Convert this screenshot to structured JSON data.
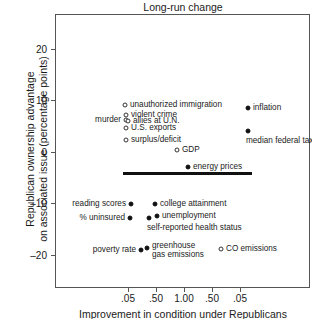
{
  "chart_data": {
    "type": "scatter",
    "title": "Long-run change",
    "xlabel": "Improvement in condition under Republicans",
    "ylabel_line1": "Republican ownership advantage",
    "ylabel_line2": "on associated issue (percentage points)",
    "grid": false,
    "legend": "none",
    "ylim": [
      -26,
      26
    ],
    "yticks": [
      "20",
      "10",
      "0",
      "–10",
      "–20"
    ],
    "ytick_values": [
      20,
      10,
      0,
      -10,
      -20
    ],
    "xticks": [
      ".05",
      ".50",
      "1.00",
      ".50",
      ".05"
    ],
    "points": [
      {
        "label": "unauthorized immigration",
        "marker": "open",
        "x_px": 125,
        "y_px": 105,
        "y_value": 8.6,
        "label_side": "right"
      },
      {
        "label": "violent crime",
        "marker": "open",
        "x_px": 126,
        "y_px": 115,
        "y_value": 7.1,
        "label_side": "right"
      },
      {
        "label": "murder",
        "marker": "open",
        "x_px": 126,
        "y_px": 120,
        "y_value": 6.2,
        "label_side": "left"
      },
      {
        "label": "allies at U.N.",
        "marker": "open",
        "x_px": 128,
        "y_px": 121,
        "y_value": 6.0,
        "label_side": "right"
      },
      {
        "label": "U.S. exports",
        "marker": "open",
        "x_px": 126,
        "y_px": 128,
        "y_value": 4.8,
        "label_side": "right"
      },
      {
        "label": "surplus/deficit",
        "marker": "open",
        "x_px": 126,
        "y_px": 140,
        "y_value": 2.4,
        "label_side": "right"
      },
      {
        "label": "GDP",
        "marker": "open",
        "x_px": 177,
        "y_px": 150,
        "y_value": 0.4,
        "label_side": "right"
      },
      {
        "label": "inflation",
        "marker": "filled",
        "x_px": 248,
        "y_px": 108,
        "y_value": 8.3,
        "label_side": "right"
      },
      {
        "label": "median federal tax rate",
        "marker": "filled",
        "x_px": 248,
        "y_px": 131,
        "y_value": 3.7,
        "label_side": "below"
      },
      {
        "label": "energy prices",
        "marker": "filled",
        "x_px": 188,
        "y_px": 167,
        "y_value": -3.0,
        "label_side": "right"
      },
      {
        "label": "reading scores",
        "marker": "filled",
        "x_px": 131,
        "y_px": 204,
        "y_value": -10.3,
        "label_side": "left"
      },
      {
        "label": "college attainment",
        "marker": "filled",
        "x_px": 155,
        "y_px": 204,
        "y_value": -10.3,
        "label_side": "right"
      },
      {
        "label": "% uninsured",
        "marker": "filled",
        "x_px": 130,
        "y_px": 218,
        "y_value": -12.8,
        "label_side": "left"
      },
      {
        "label": "self-reported health status",
        "marker": "filled",
        "x_px": 149,
        "y_px": 218,
        "y_value": -12.5,
        "label_side": "below"
      },
      {
        "label": "unemployment",
        "marker": "filled",
        "x_px": 157,
        "y_px": 216,
        "y_value": -12.0,
        "label_side": "right"
      },
      {
        "label": "poverty rate",
        "marker": "filled",
        "x_px": 141,
        "y_px": 250,
        "y_value": -18.5,
        "label_side": "left"
      },
      {
        "label": "greenhouse gas emissions",
        "marker": "filled",
        "x_px": 147,
        "y_px": 248,
        "y_value": -18.0,
        "label_side": "right-two"
      },
      {
        "label": "CO emissions",
        "marker": "open",
        "x_px": 221,
        "y_px": 249,
        "y_value": -18.2,
        "label_side": "right"
      }
    ],
    "segments": [
      {
        "name": "energy-prices-range",
        "x1_px": 123,
        "x2_px": 252,
        "y_px": 172,
        "y_value": -3.9
      }
    ]
  }
}
